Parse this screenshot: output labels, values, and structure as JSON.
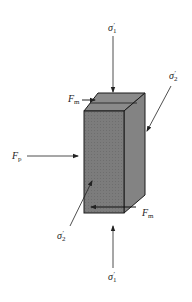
{
  "diagram": {
    "title": "",
    "block": {
      "front_face_color": "#7a7a7a",
      "top_face_color": "#8c8c8c",
      "side_face_color": "#858585",
      "edge_color": "#1a1a1a"
    },
    "labels": {
      "sigma1_top": {
        "base": "σ",
        "sub": "1",
        "sup": "′"
      },
      "sigma1_bottom": {
        "base": "σ",
        "sub": "1",
        "sup": "′"
      },
      "sigma2_right": {
        "base": "σ",
        "sub": "2",
        "sup": "′"
      },
      "sigma2_left": {
        "base": "σ",
        "sub": "2",
        "sup": "′"
      },
      "fm_top": {
        "base": "F",
        "sub": "m"
      },
      "fm_bottom": {
        "base": "F",
        "sub": "m"
      },
      "fp": {
        "base": "F",
        "sub": "p"
      }
    },
    "arrows": [
      {
        "name": "sigma1-top-arrow",
        "direction": "down"
      },
      {
        "name": "sigma1-bottom-arrow",
        "direction": "up"
      },
      {
        "name": "sigma2-right-arrow",
        "direction": "down-left"
      },
      {
        "name": "sigma2-left-arrow",
        "direction": "up-right"
      },
      {
        "name": "fp-arrow",
        "direction": "right"
      },
      {
        "name": "fm-top-arrow",
        "direction": "right"
      },
      {
        "name": "fm-bottom-arrow",
        "direction": "left"
      }
    ]
  }
}
